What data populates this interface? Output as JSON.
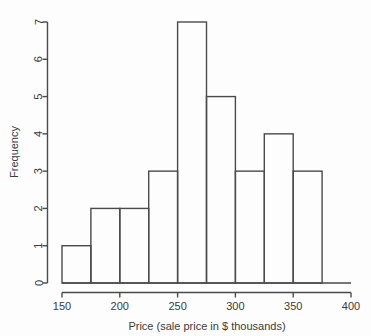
{
  "chart_data": {
    "type": "bar",
    "subtype": "histogram",
    "title": "",
    "xlabel": "Price (sale price in $ thousands)",
    "ylabel": "Frequency",
    "xlim": [
      150,
      400
    ],
    "ylim": [
      0,
      7
    ],
    "bin_width": 25,
    "bin_edges": [
      150,
      175,
      200,
      225,
      250,
      275,
      300,
      325,
      350,
      375
    ],
    "categories": [
      "150-175",
      "175-200",
      "200-225",
      "225-250",
      "250-275",
      "275-300",
      "300-325",
      "325-350",
      "350-375"
    ],
    "values": [
      1,
      2,
      2,
      3,
      7,
      5,
      3,
      4,
      3
    ],
    "bars": [
      {
        "x0": 150,
        "x1": 175,
        "frequency": 1
      },
      {
        "x0": 175,
        "x1": 200,
        "frequency": 2
      },
      {
        "x0": 200,
        "x1": 225,
        "frequency": 2
      },
      {
        "x0": 225,
        "x1": 250,
        "frequency": 3
      },
      {
        "x0": 250,
        "x1": 275,
        "frequency": 7
      },
      {
        "x0": 275,
        "x1": 300,
        "frequency": 5
      },
      {
        "x0": 300,
        "x1": 325,
        "frequency": 3
      },
      {
        "x0": 325,
        "x1": 350,
        "frequency": 4
      },
      {
        "x0": 350,
        "x1": 375,
        "frequency": 3
      }
    ],
    "total_count": 30,
    "x_ticks": [
      150,
      200,
      250,
      300,
      350,
      400
    ],
    "x_tick_labels": [
      "150",
      "200",
      "250",
      "300",
      "350",
      "400"
    ],
    "y_ticks": [
      0,
      1,
      2,
      3,
      4,
      5,
      6,
      7
    ],
    "y_tick_labels": [
      "0",
      "1",
      "2",
      "3",
      "4",
      "5",
      "6",
      "7"
    ],
    "grid": false,
    "legend": false,
    "legend_position": "none",
    "line_color": "#4a4a4a",
    "fill_color": "none",
    "background_color": "#fdfdfd"
  }
}
